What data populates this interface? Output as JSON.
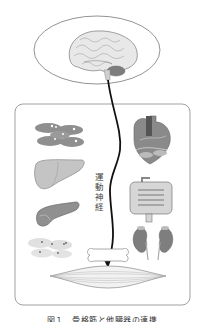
{
  "figure": {
    "nerve_label": "運動神経",
    "caption": "図１　骨格筋と他臓器の連携",
    "components": {
      "brain": "brain-illustration",
      "frame": "organs-frame",
      "organs_left": [
        "fat-tissue-cells",
        "liver",
        "pancreas",
        "fat-cells"
      ],
      "organs_right": [
        "heart",
        "intestine",
        "kidneys"
      ],
      "bottom": [
        "bone",
        "skeletal-muscle"
      ]
    },
    "colors": {
      "line": "#111111",
      "outline": "#777777",
      "organ_gray": "#8a8a8a",
      "organ_light": "#d0d0d0"
    }
  }
}
